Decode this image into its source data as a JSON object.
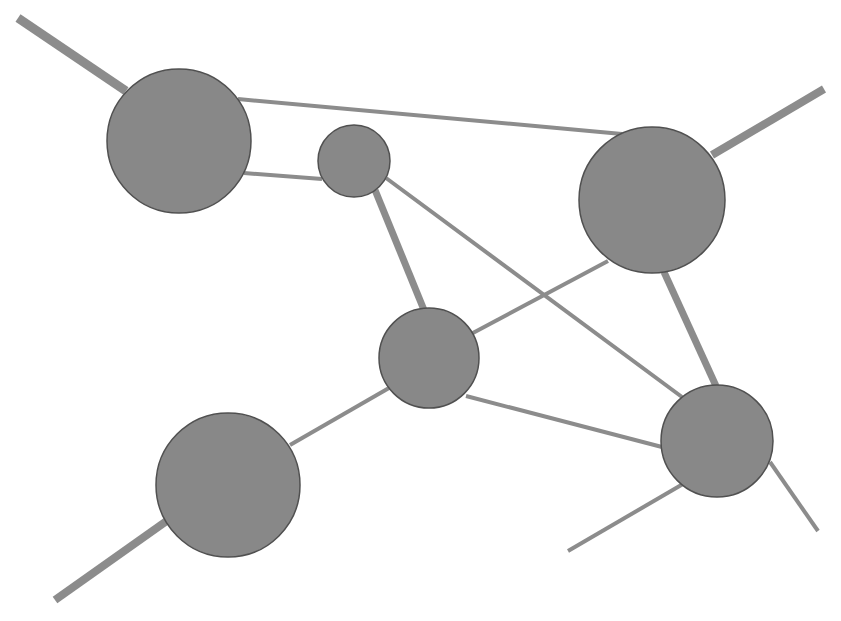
{
  "diagram": {
    "type": "network-graph",
    "width": 841,
    "height": 621,
    "colors": {
      "background": "#ffffff",
      "node_fill": "#888888",
      "node_stroke": "#505050",
      "edge": "#8c8c8c"
    },
    "nodes": [
      {
        "id": "A",
        "cx": 179,
        "cy": 141,
        "r": 72
      },
      {
        "id": "B",
        "cx": 354,
        "cy": 161,
        "r": 36
      },
      {
        "id": "C",
        "cx": 652,
        "cy": 200,
        "r": 73
      },
      {
        "id": "D",
        "cx": 429,
        "cy": 358,
        "r": 50
      },
      {
        "id": "E",
        "cx": 228,
        "cy": 485,
        "r": 72
      },
      {
        "id": "F",
        "cx": 717,
        "cy": 441,
        "r": 56
      }
    ],
    "edges": [
      {
        "from": "A",
        "to": "C",
        "x1": 238,
        "y1": 99,
        "x2": 622,
        "y2": 134,
        "width": 4
      },
      {
        "from": "A",
        "to": "B",
        "x1": 244,
        "y1": 173,
        "x2": 322,
        "y2": 179,
        "width": 4
      },
      {
        "from": "B",
        "to": "D",
        "x1": 375,
        "y1": 190,
        "x2": 424,
        "y2": 310,
        "width": 7
      },
      {
        "from": "B",
        "to": "F",
        "x1": 386,
        "y1": 178,
        "x2": 682,
        "y2": 397,
        "width": 4
      },
      {
        "from": "C",
        "to": "D",
        "x1": 608,
        "y1": 261,
        "x2": 471,
        "y2": 334,
        "width": 4
      },
      {
        "from": "C",
        "to": "F",
        "x1": 664,
        "y1": 272,
        "x2": 716,
        "y2": 386,
        "width": 7
      },
      {
        "from": "D",
        "to": "F",
        "x1": 466,
        "y1": 396,
        "x2": 662,
        "y2": 447,
        "width": 4
      },
      {
        "from": "D",
        "to": "E",
        "x1": 389,
        "y1": 388,
        "x2": 290,
        "y2": 445,
        "width": 4
      }
    ],
    "stubs": [
      {
        "node": "A",
        "x1": 18,
        "y1": 18,
        "x2": 126,
        "y2": 91,
        "width": 9
      },
      {
        "node": "C",
        "x1": 824,
        "y1": 89,
        "x2": 712,
        "y2": 155,
        "width": 8
      },
      {
        "node": "E",
        "x1": 55,
        "y1": 600,
        "x2": 168,
        "y2": 520,
        "width": 8
      },
      {
        "node": "F",
        "x1": 683,
        "y1": 484,
        "x2": 568,
        "y2": 551,
        "width": 4
      },
      {
        "node": "F",
        "x1": 770,
        "y1": 462,
        "x2": 818,
        "y2": 531,
        "width": 4
      }
    ]
  }
}
